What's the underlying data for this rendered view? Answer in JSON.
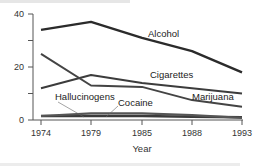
{
  "chart_data": {
    "type": "line",
    "title": "",
    "xlabel": "Year",
    "ylabel": "",
    "ylim": [
      0,
      40
    ],
    "yticks": [
      0,
      20,
      40
    ],
    "yminor_ticks": [
      10,
      30
    ],
    "categories": [
      "1974",
      "1979",
      "1985",
      "1988",
      "1993"
    ],
    "grid": false,
    "legend": "inline labels",
    "series": [
      {
        "name": "Alcohol",
        "values": [
          34,
          37,
          31,
          26,
          18
        ],
        "color": "#2b2b2b"
      },
      {
        "name": "Cigarettes",
        "values": [
          12,
          17,
          14,
          12,
          10
        ],
        "color": "#3c3c3c"
      },
      {
        "name": "Marijuana",
        "values": [
          25,
          13,
          12.5,
          7.5,
          5
        ],
        "color": "#444444"
      },
      {
        "name": "Hallucinogens",
        "values": [
          1.5,
          1.5,
          1.5,
          1.2,
          1
        ],
        "color": "#3a3a3a"
      },
      {
        "name": "Cocaine",
        "values": [
          1.5,
          2.5,
          2.5,
          1.8,
          0.8
        ],
        "color": "#555555"
      }
    ]
  },
  "labels": {
    "alcohol": "Alcohol",
    "cigarettes": "Cigarettes",
    "marijuana": "Marijuana",
    "hallucinogens": "Hallucinogens",
    "cocaine": "Cocaine",
    "xaxis_title": "Year",
    "y0": "0",
    "y20": "20",
    "y40": "40",
    "x0": "1974",
    "x1": "1979",
    "x2": "1985",
    "x3": "1988",
    "x4": "1993"
  }
}
